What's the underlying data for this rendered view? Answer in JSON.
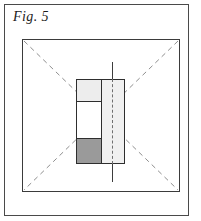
{
  "figure": {
    "label": "Fig. 5",
    "caption_style": "italic-serif"
  },
  "colors": {
    "page_background": "#ffffff",
    "page_frame_stroke": "#4a4a4a",
    "outer_square_stroke": "#3b3b3b",
    "diagonal_dashed_stroke": "#8c8c8c",
    "assembly_stroke": "#2e2e2e",
    "cell_top_fill": "#ededed",
    "cell_middle_fill": "#ffffff",
    "cell_bottom_fill": "#9a9a9a",
    "right_panel_fill": "#f0f0f0",
    "center_line_stroke": "#3d3d3d",
    "center_line_dashed_stroke": "#6f6f6f",
    "label_text": "#1c1c1c"
  },
  "diagram": {
    "page_frame": {
      "name": "page-frame",
      "x": 4,
      "y": 4,
      "width": 185,
      "height": 212
    },
    "outer_square": {
      "name": "outer-square",
      "x": 22,
      "y": 39,
      "width": 158,
      "height": 153
    },
    "diagonals": [
      {
        "name": "diagonal-top-left-to-bottom-right",
        "x1": 22,
        "y1": 39,
        "x2": 180,
        "y2": 192
      },
      {
        "name": "diagonal-top-right-to-bottom-left",
        "x1": 180,
        "y1": 39,
        "x2": 22,
        "y2": 192
      }
    ],
    "center_assembly": {
      "name": "center-assembly",
      "x": 76,
      "y": 79,
      "width": 49,
      "height": 85
    },
    "left_stack": {
      "name": "left-stack",
      "width": 25,
      "cells": [
        {
          "name": "cell-top",
          "fill": "#ededed",
          "height": 22
        },
        {
          "name": "cell-middle",
          "fill": "#ffffff",
          "height": 37
        },
        {
          "name": "cell-bottom",
          "fill": "#9a9a9a",
          "height": 24
        }
      ]
    },
    "right_panel": {
      "name": "right-panel",
      "fill": "#f0f0f0",
      "width": 22,
      "height": 85
    },
    "center_line": {
      "name": "center-line",
      "x": 112,
      "top_tail": {
        "y": 62,
        "height": 18,
        "style": "solid"
      },
      "through_panel": {
        "y": 79,
        "height": 85,
        "style": "dashed"
      },
      "bottom_tail": {
        "y": 163,
        "height": 19,
        "style": "solid"
      }
    }
  }
}
